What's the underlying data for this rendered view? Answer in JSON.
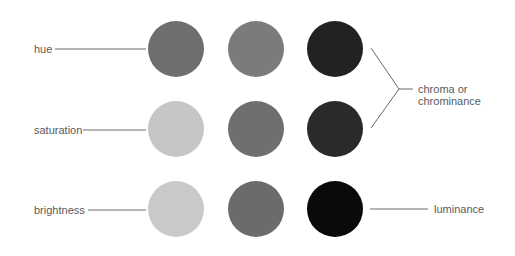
{
  "diagram": {
    "left_labels": [
      {
        "text": "hue"
      },
      {
        "text": "saturation"
      },
      {
        "text": "brightness"
      }
    ],
    "right_labels": {
      "chroma_line1": "chroma or",
      "chroma_line2": "chrominance",
      "luminance": "luminance"
    },
    "circles": [
      [
        "#6e6e6e",
        "#7b7b7b",
        "#222222"
      ],
      [
        "#c6c6c6",
        "#6f6f6f",
        "#2a2a2a"
      ],
      [
        "#c9c9c9",
        "#6b6b6b",
        "#0a0a0a"
      ]
    ],
    "line_color": "#6a6a6a"
  }
}
